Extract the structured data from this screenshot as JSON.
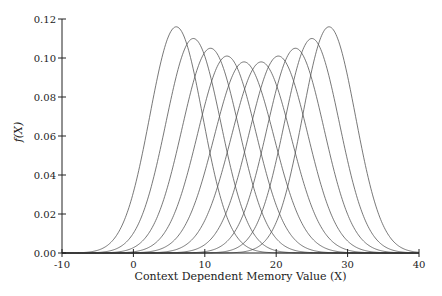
{
  "chart_data": {
    "type": "line",
    "title": "",
    "xlabel": "Context Dependent Memory Value (X)",
    "ylabel": "f(X)",
    "xlim": [
      -10,
      40
    ],
    "ylim": [
      0,
      0.12
    ],
    "xticks": [
      -10,
      0,
      10,
      20,
      30,
      40
    ],
    "xtick_labels": [
      "-10",
      "0",
      "10",
      "20",
      "30",
      "40"
    ],
    "yticks": [
      0.0,
      0.02,
      0.04,
      0.06,
      0.08,
      0.1,
      0.12
    ],
    "ytick_labels": [
      "0.00",
      "0.02",
      "0.04",
      "0.06",
      "0.08",
      "0.10",
      "0.12"
    ],
    "grid": false,
    "legend": null,
    "line_color": "#555555",
    "series_description": "Ten bell-shaped density curves with evenly spaced centers; outer curves are taller and narrower, inner curves shorter and wider",
    "series": [
      {
        "name": "curve-1",
        "mean": 6.0,
        "peak": 0.116,
        "sigma": 3.7
      },
      {
        "name": "curve-2",
        "mean": 8.4,
        "peak": 0.11,
        "sigma": 3.85
      },
      {
        "name": "curve-3",
        "mean": 10.8,
        "peak": 0.105,
        "sigma": 4.0
      },
      {
        "name": "curve-4",
        "mean": 13.1,
        "peak": 0.101,
        "sigma": 4.1
      },
      {
        "name": "curve-5",
        "mean": 15.5,
        "peak": 0.098,
        "sigma": 4.2
      },
      {
        "name": "curve-6",
        "mean": 17.9,
        "peak": 0.098,
        "sigma": 4.2
      },
      {
        "name": "curve-7",
        "mean": 20.3,
        "peak": 0.101,
        "sigma": 4.1
      },
      {
        "name": "curve-8",
        "mean": 22.7,
        "peak": 0.105,
        "sigma": 4.0
      },
      {
        "name": "curve-9",
        "mean": 25.0,
        "peak": 0.11,
        "sigma": 3.85
      },
      {
        "name": "curve-10",
        "mean": 27.4,
        "peak": 0.116,
        "sigma": 3.7
      }
    ]
  },
  "layout": {
    "plot_left_px": 62,
    "plot_right_px": 419,
    "plot_top_px": 19,
    "plot_bottom_px": 253
  }
}
